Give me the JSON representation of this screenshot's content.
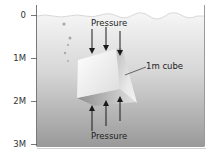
{
  "diagram": {
    "depth_axis": {
      "ticks": [
        {
          "label": "0",
          "y": 15
        },
        {
          "label": "1M",
          "y": 58
        },
        {
          "label": "2M",
          "y": 101
        },
        {
          "label": "3M",
          "y": 144
        }
      ]
    },
    "labels": {
      "pressure_top": "Pressure",
      "pressure_bottom": "Pressure",
      "cube": "1m cube"
    },
    "colors": {
      "water_top": "#f4f4f4",
      "water_bottom": "#9c9c9c",
      "frame": "#8a8a8a",
      "arrow": "#1a1a1a",
      "text": "#222222"
    }
  }
}
